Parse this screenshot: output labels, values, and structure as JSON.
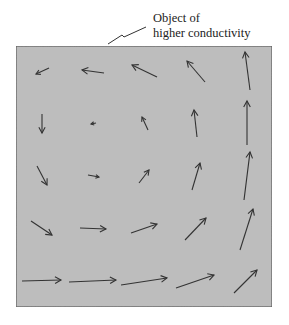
{
  "annotation": {
    "line1": "Object of",
    "line2": "higher conductivity"
  },
  "colors": {
    "region_fill": "#bdbdbd",
    "region_border": "#555555",
    "arrow": "#333333",
    "background": "#ffffff"
  },
  "region": {
    "x": 16,
    "y": 46,
    "width": 256,
    "height": 261
  },
  "leader_line": [
    [
      108,
      44
    ],
    [
      122,
      35
    ],
    [
      124,
      37
    ],
    [
      146,
      27
    ]
  ],
  "vector_field": {
    "rows": [
      [
        {
          "x1": 49,
          "y1": 68,
          "x2": 36,
          "y2": 74
        },
        {
          "x1": 104,
          "y1": 73,
          "x2": 82,
          "y2": 70
        },
        {
          "x1": 157,
          "y1": 77,
          "x2": 132,
          "y2": 65
        },
        {
          "x1": 205,
          "y1": 82,
          "x2": 187,
          "y2": 61
        },
        {
          "x1": 250,
          "y1": 90,
          "x2": 245,
          "y2": 52
        }
      ],
      [
        {
          "x1": 42,
          "y1": 114,
          "x2": 42,
          "y2": 133
        },
        {
          "x1": 96,
          "y1": 123,
          "x2": 91,
          "y2": 124
        },
        {
          "x1": 148,
          "y1": 130,
          "x2": 142,
          "y2": 117
        },
        {
          "x1": 197,
          "y1": 137,
          "x2": 194,
          "y2": 110
        },
        {
          "x1": 247,
          "y1": 145,
          "x2": 247,
          "y2": 101
        }
      ],
      [
        {
          "x1": 37,
          "y1": 166,
          "x2": 47,
          "y2": 185
        },
        {
          "x1": 88,
          "y1": 175,
          "x2": 99,
          "y2": 177
        },
        {
          "x1": 139,
          "y1": 183,
          "x2": 149,
          "y2": 170
        },
        {
          "x1": 192,
          "y1": 190,
          "x2": 200,
          "y2": 163
        },
        {
          "x1": 244,
          "y1": 200,
          "x2": 250,
          "y2": 152
        }
      ],
      [
        {
          "x1": 31,
          "y1": 221,
          "x2": 52,
          "y2": 235
        },
        {
          "x1": 80,
          "y1": 228,
          "x2": 106,
          "y2": 229
        },
        {
          "x1": 131,
          "y1": 233,
          "x2": 157,
          "y2": 224
        },
        {
          "x1": 185,
          "y1": 240,
          "x2": 206,
          "y2": 218
        },
        {
          "x1": 240,
          "y1": 250,
          "x2": 253,
          "y2": 209
        }
      ],
      [
        {
          "x1": 22,
          "y1": 281,
          "x2": 61,
          "y2": 280
        },
        {
          "x1": 69,
          "y1": 282,
          "x2": 116,
          "y2": 280
        },
        {
          "x1": 121,
          "y1": 285,
          "x2": 167,
          "y2": 278
        },
        {
          "x1": 176,
          "y1": 288,
          "x2": 214,
          "y2": 275
        },
        {
          "x1": 234,
          "y1": 293,
          "x2": 257,
          "y2": 270
        }
      ]
    ]
  }
}
